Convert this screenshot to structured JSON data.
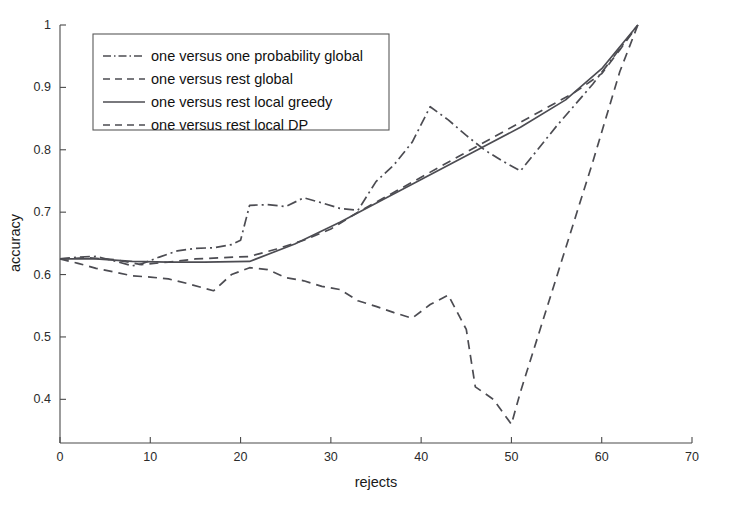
{
  "chart_data": {
    "type": "line",
    "title": "",
    "xlabel": "rejects",
    "ylabel": "accuracy",
    "xlim": [
      0,
      70
    ],
    "ylim": [
      0.33,
      1.0
    ],
    "grid": false,
    "legend_position": "upper-left",
    "xticks": [
      0,
      10,
      20,
      30,
      40,
      50,
      60,
      70
    ],
    "xtick_labels": [
      "0",
      "10",
      "20",
      "30",
      "40",
      "50",
      "60",
      "70"
    ],
    "yticks": [
      0.4,
      0.5,
      0.6,
      0.7,
      0.8,
      0.9,
      1.0
    ],
    "ytick_labels": [
      "0.4",
      "0.5",
      "0.6",
      "0.7",
      "0.8",
      "0.9",
      "1"
    ],
    "series": [
      {
        "name": "one versus one probability global",
        "style": "dash-dot",
        "color": "#4c4c52",
        "points": [
          [
            0,
            0.625
          ],
          [
            2,
            0.628
          ],
          [
            4,
            0.629
          ],
          [
            6,
            0.622
          ],
          [
            8,
            0.614
          ],
          [
            9,
            0.617
          ],
          [
            11,
            0.628
          ],
          [
            13,
            0.638
          ],
          [
            15,
            0.642
          ],
          [
            17,
            0.643
          ],
          [
            19,
            0.648
          ],
          [
            20,
            0.655
          ],
          [
            21,
            0.711
          ],
          [
            23,
            0.712
          ],
          [
            25,
            0.709
          ],
          [
            27,
            0.723
          ],
          [
            29,
            0.715
          ],
          [
            31,
            0.706
          ],
          [
            33,
            0.703
          ],
          [
            35,
            0.749
          ],
          [
            37,
            0.776
          ],
          [
            39,
            0.812
          ],
          [
            41,
            0.869
          ],
          [
            43,
            0.848
          ],
          [
            45,
            0.823
          ],
          [
            47,
            0.8
          ],
          [
            49,
            0.782
          ],
          [
            51,
            0.766
          ],
          [
            55,
            0.838
          ],
          [
            59,
            0.905
          ],
          [
            62,
            0.962
          ],
          [
            64,
            1.0
          ]
        ]
      },
      {
        "name": "one versus rest global",
        "style": "dashed",
        "color": "#4c4c52",
        "points": [
          [
            0,
            0.625
          ],
          [
            3,
            0.627
          ],
          [
            6,
            0.624
          ],
          [
            9,
            0.616
          ],
          [
            12,
            0.62
          ],
          [
            15,
            0.625
          ],
          [
            18,
            0.627
          ],
          [
            21,
            0.629
          ],
          [
            24,
            0.641
          ],
          [
            27,
            0.655
          ],
          [
            30,
            0.673
          ],
          [
            33,
            0.7
          ],
          [
            36,
            0.724
          ],
          [
            39,
            0.748
          ],
          [
            42,
            0.772
          ],
          [
            45,
            0.796
          ],
          [
            48,
            0.82
          ],
          [
            51,
            0.844
          ],
          [
            54,
            0.868
          ],
          [
            57,
            0.892
          ],
          [
            60,
            0.922
          ],
          [
            62,
            0.96
          ],
          [
            64,
            1.0
          ]
        ]
      },
      {
        "name": "one versus rest local greedy",
        "style": "solid",
        "color": "#4c4c52",
        "points": [
          [
            0,
            0.625
          ],
          [
            4,
            0.625
          ],
          [
            8,
            0.621
          ],
          [
            12,
            0.62
          ],
          [
            16,
            0.62
          ],
          [
            21,
            0.621
          ],
          [
            26,
            0.649
          ],
          [
            31,
            0.684
          ],
          [
            36,
            0.722
          ],
          [
            41,
            0.76
          ],
          [
            46,
            0.798
          ],
          [
            51,
            0.836
          ],
          [
            56,
            0.88
          ],
          [
            60,
            0.93
          ],
          [
            64,
            1.0
          ]
        ]
      },
      {
        "name": "one versus rest local DP",
        "style": "dashed",
        "color": "#4c4c52",
        "points": [
          [
            0,
            0.625
          ],
          [
            2,
            0.618
          ],
          [
            4,
            0.61
          ],
          [
            6,
            0.604
          ],
          [
            8,
            0.598
          ],
          [
            10,
            0.596
          ],
          [
            12,
            0.593
          ],
          [
            14,
            0.586
          ],
          [
            16,
            0.578
          ],
          [
            17,
            0.574
          ],
          [
            19,
            0.6
          ],
          [
            21,
            0.611
          ],
          [
            23,
            0.608
          ],
          [
            25,
            0.595
          ],
          [
            27,
            0.59
          ],
          [
            29,
            0.581
          ],
          [
            31,
            0.576
          ],
          [
            33,
            0.558
          ],
          [
            35,
            0.549
          ],
          [
            37,
            0.539
          ],
          [
            39,
            0.53
          ],
          [
            41,
            0.552
          ],
          [
            43,
            0.567
          ],
          [
            45,
            0.512
          ],
          [
            46,
            0.42
          ],
          [
            48,
            0.4
          ],
          [
            50,
            0.36
          ],
          [
            51,
            0.412
          ],
          [
            55,
            0.596
          ],
          [
            59,
            0.78
          ],
          [
            62,
            0.925
          ],
          [
            64,
            1.0
          ]
        ]
      }
    ]
  },
  "legend": {
    "entries": [
      {
        "label": "one versus one probability global",
        "style": "dash-dot"
      },
      {
        "label": "one versus rest global",
        "style": "dashed"
      },
      {
        "label": "one versus rest local greedy",
        "style": "solid"
      },
      {
        "label": "one versus rest local DP",
        "style": "dashed"
      }
    ]
  },
  "colors": {
    "line": "#4c4c52",
    "axis": "#4a4a4a",
    "background": "#ffffff",
    "text": "#1a1a1a"
  }
}
